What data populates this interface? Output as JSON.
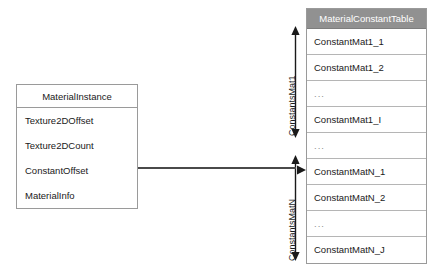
{
  "diagram": {
    "background_color": "#ffffff",
    "line_color": "#4a4a4a"
  },
  "material_instance": {
    "header": "MaterialInstance",
    "fields": [
      "Texture2DOffset",
      "Texture2DCount",
      "ConstantOffset",
      "MaterialInfo"
    ]
  },
  "constant_table": {
    "header": "MaterialConstantTable",
    "header_bg": "#919191",
    "header_color": "#ffffff",
    "rows": [
      "ConstantMat1_1",
      "ConstantMat1_2",
      "...",
      "ConstantMat1_I",
      "...",
      "ConstantMatN_1",
      "ConstantMatN_2",
      "...",
      "ConstantMatN_J"
    ]
  },
  "ranges": [
    {
      "label": "ConstantsMat1"
    },
    {
      "label": "ConstantsMatN"
    }
  ]
}
